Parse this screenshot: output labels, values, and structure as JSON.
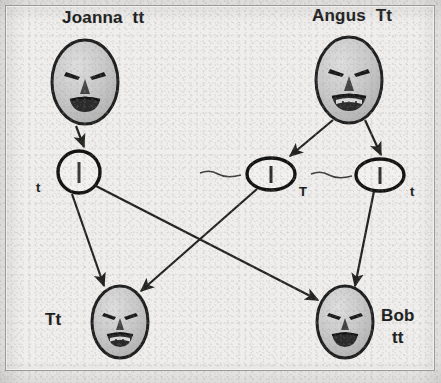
{
  "diagram": {
    "title_absent": true,
    "background_color": "#efeeec",
    "ink_color": "#1c1c1c",
    "face_fill": "#c9c9c9",
    "type": "genetics-inheritance-pedigree"
  },
  "parents": [
    {
      "id": "joanna",
      "name": "Joanna",
      "genotype": "tt",
      "label": "Joanna  tt",
      "mouth": "open-plain",
      "x": 85,
      "y": 82
    },
    {
      "id": "angus",
      "name": "Angus",
      "genotype": "Tt",
      "label": "Angus  Tt",
      "mouth": "open-teeth",
      "x": 349,
      "y": 80
    }
  ],
  "gametes": [
    {
      "id": "gamete-joanna-t",
      "allele": "t",
      "from": "joanna",
      "shape": "circle",
      "x": 79,
      "y": 172
    },
    {
      "id": "gamete-angus-T",
      "allele": "T",
      "from": "angus",
      "shape": "ellipse",
      "x": 271,
      "y": 174
    },
    {
      "id": "gamete-angus-t",
      "allele": "t",
      "from": "angus",
      "shape": "ellipse",
      "x": 380,
      "y": 175
    }
  ],
  "children": [
    {
      "id": "child-left",
      "name": "",
      "genotype": "Tt",
      "label": "Tt",
      "mouth": "open-teeth",
      "x": 120,
      "y": 322
    },
    {
      "id": "child-bob",
      "name": "Bob",
      "genotype": "tt",
      "label_name": "Bob",
      "label_geno": "tt",
      "mouth": "open-plain",
      "x": 345,
      "y": 322
    }
  ],
  "arrows": [
    {
      "id": "arrow-joanna-to-gamete",
      "from": "joanna",
      "to": "gamete-joanna-t"
    },
    {
      "id": "arrow-angus-to-gameteT",
      "from": "angus",
      "to": "gamete-angus-T"
    },
    {
      "id": "arrow-angus-to-gamete-t",
      "from": "angus",
      "to": "gamete-angus-t"
    },
    {
      "id": "arrow-gamete-joanna-to-bob",
      "from": "gamete-joanna-t",
      "to": "child-bob"
    },
    {
      "id": "arrow-gameteT-to-child-left",
      "from": "gamete-angus-T",
      "to": "child-left"
    },
    {
      "id": "arrow-gamete-t-to-bob",
      "from": "gamete-angus-t",
      "to": "child-bob"
    }
  ]
}
